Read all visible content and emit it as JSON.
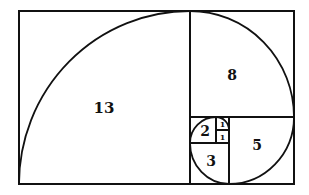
{
  "diagram": {
    "squares": [
      {
        "label": "13",
        "size": 13
      },
      {
        "label": "8",
        "size": 8
      },
      {
        "label": "5",
        "size": 5
      },
      {
        "label": "3",
        "size": 3
      },
      {
        "label": "2",
        "size": 2
      },
      {
        "label": "1",
        "size": 1
      },
      {
        "label": "1",
        "size": 1
      }
    ],
    "colors": {
      "stroke": "#111111",
      "background": "#ffffff"
    }
  }
}
